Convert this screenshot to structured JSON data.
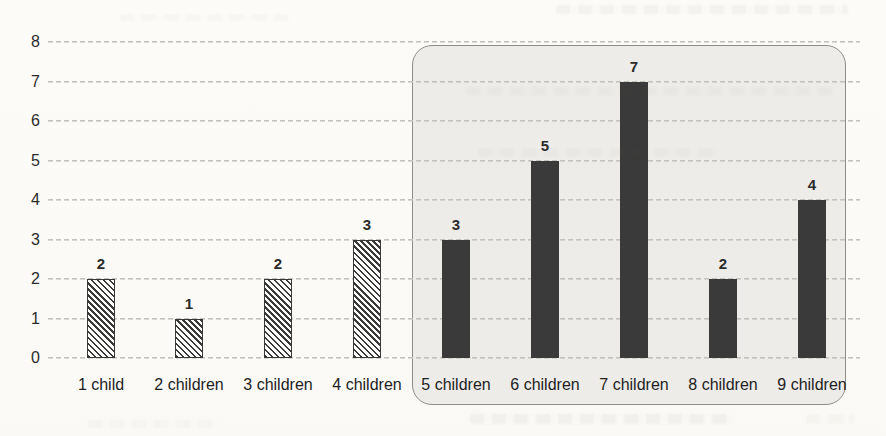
{
  "chart_data": {
    "type": "bar",
    "title": "",
    "xlabel": "",
    "ylabel": "",
    "categories": [
      "1 child",
      "2 children",
      "3 children",
      "4 children",
      "5 children",
      "6 children",
      "7 children",
      "8 children",
      "9 children"
    ],
    "values": [
      2,
      1,
      2,
      3,
      3,
      5,
      7,
      2,
      4
    ],
    "data_labels": [
      "2",
      "1",
      "2",
      "3",
      "3",
      "5",
      "7",
      "2",
      "4"
    ],
    "bar_styles": [
      "hatched",
      "hatched",
      "hatched",
      "hatched",
      "solid",
      "solid",
      "solid",
      "solid",
      "solid"
    ],
    "y_ticks": [
      "0",
      "1",
      "2",
      "3",
      "4",
      "5",
      "6",
      "7",
      "8"
    ],
    "ylim": [
      0,
      8
    ],
    "grid": "horizontal-dashed",
    "legend": "none",
    "annotations": [
      {
        "type": "rounded-highlight-box",
        "from_category": "5 children",
        "to_category": "9 children"
      }
    ],
    "colors": {
      "solid_bar": "#3a3a3a",
      "hatch_stroke": "#3a3a3a",
      "hatch_fill": "#fdfdfb",
      "gridline": "#c3c2bd",
      "box_fill": "#edece8",
      "box_border": "#8d8d89",
      "text": "#2b2b2b",
      "paper": "#fcfbf8"
    }
  }
}
